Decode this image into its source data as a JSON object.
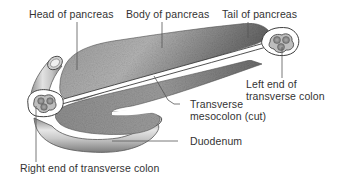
{
  "diagram": {
    "labels": {
      "head": "Head of pancreas",
      "body": "Body of pancreas",
      "tail": "Tail of pancreas",
      "left_colon_line1": "Left end of",
      "left_colon_line2": "transverse colon",
      "mesocolon_line1": "Transverse",
      "mesocolon_line2": "mesocolon (cut)",
      "duodenum": "Duodenum",
      "right_colon": "Right end of transverse colon"
    },
    "colors": {
      "pancreas": "#8a8a8a",
      "pancreas_dark": "#5e5e5e",
      "tube_light": "#d8d8d8",
      "tube_dark": "#8c8c8c",
      "outline": "#4a4a4a",
      "leader_line": "#555555",
      "text": "#333333"
    }
  }
}
